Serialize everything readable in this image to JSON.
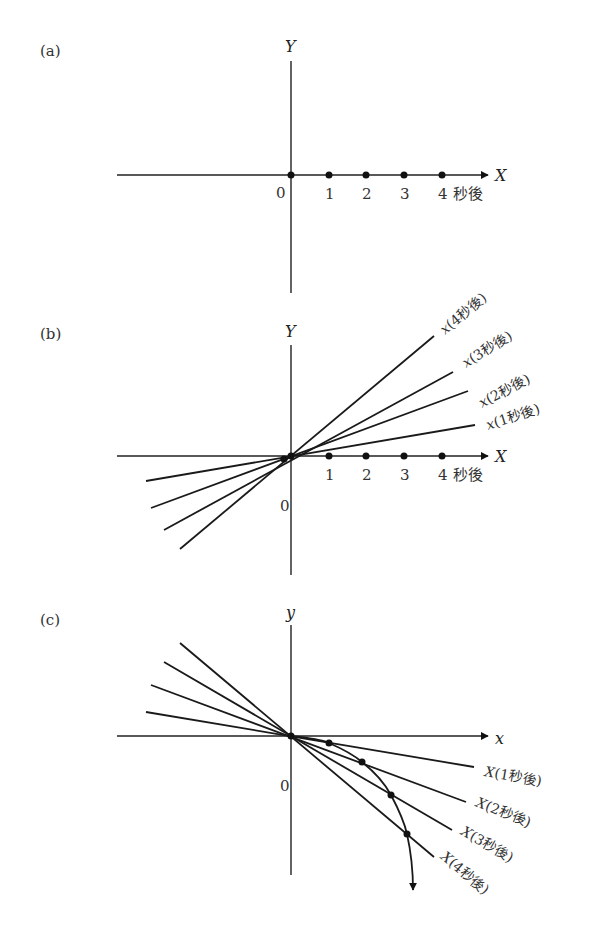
{
  "panels": [
    {
      "id": "a",
      "label": "(a)",
      "y_axis_label": "Y",
      "x_axis_label": "X",
      "origin_label": "0",
      "ticks": [
        "1",
        "2",
        "3",
        "4"
      ],
      "unit_label": "秒後"
    },
    {
      "id": "b",
      "label": "(b)",
      "y_axis_label": "Y",
      "x_axis_label": "X",
      "origin_label": "0",
      "ticks": [
        "1",
        "2",
        "3",
        "4"
      ],
      "unit_label": "秒後",
      "lines": [
        {
          "var": "x",
          "label": "(1秒後)"
        },
        {
          "var": "x",
          "label": "(2秒後)"
        },
        {
          "var": "x",
          "label": "(3秒後)"
        },
        {
          "var": "x",
          "label": "(4秒後)"
        }
      ]
    },
    {
      "id": "c",
      "label": "(c)",
      "y_axis_label": "y",
      "x_axis_label": "x",
      "origin_label": "0",
      "lines": [
        {
          "var": "X",
          "label": "(1秒後)"
        },
        {
          "var": "X",
          "label": "(2秒後)"
        },
        {
          "var": "X",
          "label": "(3秒後)"
        },
        {
          "var": "X",
          "label": "(4秒後)"
        }
      ]
    }
  ]
}
